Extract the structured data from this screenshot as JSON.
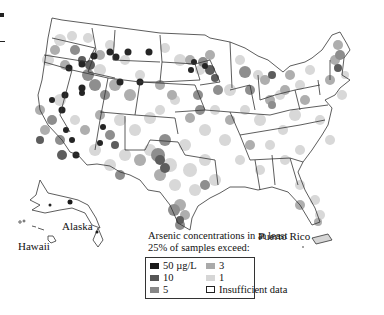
{
  "figure": {
    "labels": {
      "hawaii": "Hawaii",
      "alaska": "Alaska",
      "puerto_rico": "Puerto Rico"
    }
  },
  "legend": {
    "title_line1": "Arsenic concentrations in at least",
    "title_line2": "25% of samples exceed:",
    "items": [
      {
        "label": "50 µg/L",
        "color": "#1a1a1a"
      },
      {
        "label": "10",
        "color": "#555555"
      },
      {
        "label": "5",
        "color": "#888888"
      },
      {
        "label": "3",
        "color": "#aaaaaa"
      },
      {
        "label": "1",
        "color": "#d6d6d6"
      },
      {
        "label": "Insufficient data",
        "color": "#ffffff"
      }
    ]
  },
  "colors": {
    "c50": "#1a1a1a",
    "c10": "#555555",
    "c5": "#888888",
    "c3": "#aaaaaa",
    "c1": "#d6d6d6",
    "outline": "#333333"
  }
}
